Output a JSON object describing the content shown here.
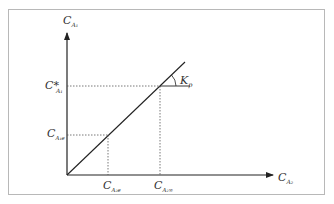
{
  "diagram": {
    "axes": {
      "y_label": {
        "main": "C",
        "sub": "A₁"
      },
      "x_label": {
        "main": "C",
        "sub": "A₂"
      }
    },
    "y_marks": [
      {
        "main": "C*",
        "sub": "A₁",
        "id": "c-star-a1"
      },
      {
        "main": "C",
        "sub": "A₁e",
        "id": "c-a1e"
      }
    ],
    "x_marks": [
      {
        "main": "C",
        "sub": "A₂e",
        "id": "c-a2e"
      },
      {
        "main": "C",
        "sub": "A₂∞",
        "id": "c-a2-inf"
      }
    ],
    "slope_label": {
      "main": "K",
      "sub": "p"
    },
    "colors": {
      "line": "#222222",
      "dotted": "#555555",
      "frame": "#b8b8b8"
    }
  }
}
